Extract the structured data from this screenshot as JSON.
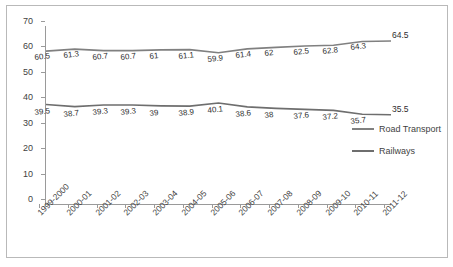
{
  "chart_data": {
    "type": "line",
    "title": "",
    "xlabel": "",
    "ylabel": "",
    "ylim": [
      0,
      70
    ],
    "ytick_step": 10,
    "yticks": [
      0,
      10,
      20,
      30,
      40,
      50,
      60,
      70
    ],
    "grid": false,
    "legend_position": "right",
    "categories": [
      "1999-2000",
      "2000-01",
      "2001-02",
      "2002-03",
      "2003-04",
      "2004-05",
      "2005-06",
      "2006-07",
      "2007-08",
      "2008-09",
      "2009-10",
      "2010-11",
      "2011-12"
    ],
    "series": [
      {
        "name": "Road Transport",
        "color": "#808080",
        "values": [
          60.5,
          61.3,
          60.7,
          60.7,
          61,
          61.1,
          59.9,
          61.4,
          62,
          62.5,
          62.8,
          64.3,
          64.5
        ]
      },
      {
        "name": "Railways",
        "color": "#6e6e6e",
        "values": [
          39.5,
          38.7,
          39.3,
          39.3,
          39,
          38.9,
          40.1,
          38.6,
          38,
          37.6,
          37.2,
          35.7,
          35.5
        ]
      }
    ]
  },
  "legend": {
    "items": [
      {
        "label": "Road Transport"
      },
      {
        "label": "Railways"
      }
    ]
  }
}
